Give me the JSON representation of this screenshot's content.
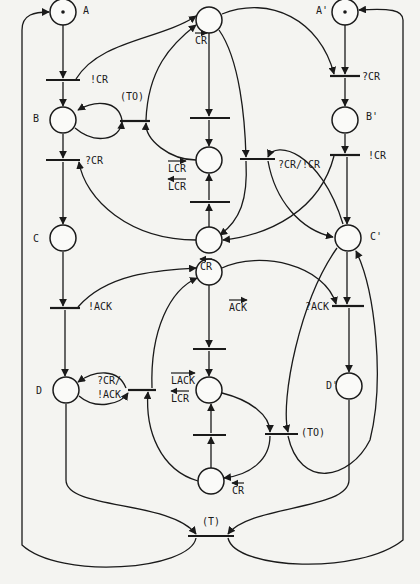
{
  "diagram": {
    "type": "petri-net",
    "places": [
      {
        "id": "A",
        "label": "A",
        "cx": 63,
        "cy": 12,
        "token": true,
        "lx": 83,
        "ly": 14
      },
      {
        "id": "B",
        "label": "B",
        "cx": 63,
        "cy": 120,
        "token": false,
        "lx": 33,
        "ly": 122
      },
      {
        "id": "C",
        "label": "C",
        "cx": 63,
        "cy": 238,
        "token": false,
        "lx": 33,
        "ly": 242
      },
      {
        "id": "D",
        "label": "D",
        "cx": 66,
        "cy": 390,
        "token": false,
        "lx": 36,
        "ly": 394
      },
      {
        "id": "A'",
        "label": "A'",
        "cx": 345,
        "cy": 12,
        "token": true,
        "lx": 316,
        "ly": 14
      },
      {
        "id": "B'",
        "label": "B'",
        "cx": 345,
        "cy": 120,
        "token": false,
        "lx": 366,
        "ly": 120
      },
      {
        "id": "C'",
        "label": "C'",
        "cx": 348,
        "cy": 238,
        "token": false,
        "lx": 370,
        "ly": 240
      },
      {
        "id": "D'",
        "label": "D'",
        "cx": 349,
        "cy": 386,
        "token": false,
        "lx": 326,
        "ly": 389
      },
      {
        "id": "P1",
        "label": "",
        "cx": 209,
        "cy": 20,
        "token": false
      },
      {
        "id": "P2",
        "label": "",
        "cx": 209,
        "cy": 160,
        "token": false
      },
      {
        "id": "P3",
        "label": "",
        "cx": 209,
        "cy": 240,
        "token": false
      },
      {
        "id": "P4",
        "label": "",
        "cx": 209,
        "cy": 272,
        "token": false
      },
      {
        "id": "P5",
        "label": "",
        "cx": 209,
        "cy": 390,
        "token": false
      },
      {
        "id": "P6",
        "label": "",
        "cx": 211,
        "cy": 481,
        "token": false
      }
    ],
    "transitions": [
      {
        "id": "t_lcr_A",
        "label": "!CR",
        "x1": 46,
        "x2": 80,
        "y": 80,
        "lx": 90,
        "ly": 83
      },
      {
        "id": "t_to_top",
        "label": "(TO)",
        "x1": 120,
        "x2": 150,
        "y": 121,
        "lx": 120,
        "ly": 100
      },
      {
        "id": "t_qcr_B",
        "label": "?CR",
        "x1": 46,
        "x2": 80,
        "y": 160,
        "lx": 85,
        "ly": 164
      },
      {
        "id": "t_ack_C",
        "label": "!ACK",
        "x1": 50,
        "x2": 80,
        "y": 308,
        "lx": 88,
        "ly": 310
      },
      {
        "id": "t_mid_top",
        "label": "",
        "x1": 190,
        "x2": 230,
        "y": 118
      },
      {
        "id": "t_mid_bot",
        "label": "",
        "x1": 190,
        "x2": 230,
        "y": 202
      },
      {
        "id": "t_qcr_lcr",
        "label": "?CR/!CR",
        "x1": 240,
        "x2": 275,
        "y": 159,
        "lx": 278,
        "ly": 168
      },
      {
        "id": "t_qcr_A2",
        "label": "?CR",
        "x1": 330,
        "x2": 360,
        "y": 76,
        "lx": 362,
        "ly": 80
      },
      {
        "id": "t_lcr_B2",
        "label": "!CR",
        "x1": 330,
        "x2": 360,
        "y": 155,
        "lx": 368,
        "ly": 159
      },
      {
        "id": "t_qack_C2",
        "label": "?ACK",
        "x1": 332,
        "x2": 364,
        "y": 306,
        "lx": 305,
        "ly": 310
      },
      {
        "id": "t_qcr_ack_D",
        "label": "",
        "x1": 128,
        "x2": 156,
        "y": 390
      },
      {
        "id": "t_mid2_top",
        "label": "",
        "x1": 193,
        "x2": 226,
        "y": 349
      },
      {
        "id": "t_mid2_bot",
        "label": "",
        "x1": 193,
        "x2": 226,
        "y": 435
      },
      {
        "id": "t_to_bot",
        "label": "(TO)",
        "x1": 265,
        "x2": 298,
        "y": 434,
        "lx": 301,
        "ly": 436
      },
      {
        "id": "t_T",
        "label": "(T)",
        "x1": 188,
        "x2": 234,
        "y": 536,
        "lx": 202,
        "ly": 525
      }
    ],
    "labels": [
      {
        "id": "lbl_cr_top",
        "text": "CR",
        "x": 195,
        "y": 44,
        "arrow": "right"
      },
      {
        "id": "lbl_lcr_up",
        "text": "LCR",
        "x": 168,
        "y": 172,
        "arrow": "right"
      },
      {
        "id": "lbl_lcr_dn",
        "text": "LCR",
        "x": 168,
        "y": 190,
        "arrow": "left"
      },
      {
        "id": "lbl_cr_mid",
        "text": "CR",
        "x": 200,
        "y": 270,
        "arrow": "left"
      },
      {
        "id": "lbl_ack",
        "text": "ACK",
        "x": 229,
        "y": 311,
        "arrow": "right"
      },
      {
        "id": "lbl_lack",
        "text": "LACK",
        "x": 171,
        "y": 384,
        "arrow": "right"
      },
      {
        "id": "lbl_lcr2",
        "text": "LCR",
        "x": 171,
        "y": 402,
        "arrow": "left"
      },
      {
        "id": "lbl_qcr_ack1",
        "text": "?CR/",
        "x": 97,
        "y": 384,
        "arrow": "none"
      },
      {
        "id": "lbl_qcr_ack2",
        "text": "!ACK",
        "x": 97,
        "y": 398,
        "arrow": "none"
      },
      {
        "id": "lbl_cr_bot",
        "text": "CR",
        "x": 232,
        "y": 494,
        "arrow": "left"
      }
    ]
  }
}
